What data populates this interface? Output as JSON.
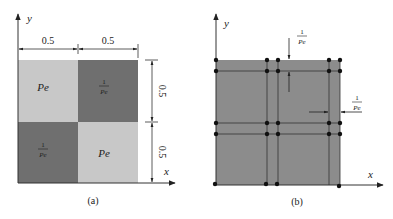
{
  "figure_a": {
    "caption": "(a)",
    "axis_x": "x",
    "axis_y": "y",
    "dim_top_left": "0.5",
    "dim_top_right": "0.5",
    "dim_right_top": "0.5",
    "dim_right_bottom": "0.5",
    "cells": [
      {
        "pos": "top-left",
        "label": "Pe",
        "shade": "light"
      },
      {
        "pos": "top-right",
        "label": "1/Pe",
        "num": "1",
        "den": "Pe",
        "shade": "dark"
      },
      {
        "pos": "bottom-left",
        "label": "1/Pe",
        "num": "1",
        "den": "Pe",
        "shade": "dark"
      },
      {
        "pos": "bottom-right",
        "label": "Pe",
        "shade": "light"
      }
    ]
  },
  "figure_b": {
    "caption": "(b)",
    "axis_x": "x",
    "axis_y": "y",
    "annot_top": {
      "num": "1",
      "den": "Pe"
    },
    "annot_right": {
      "num": "1",
      "den": "Pe"
    }
  },
  "colors": {
    "light": "#c8c8c8",
    "dark": "#6f6f6f",
    "mesh_fill": "#8c8c8c",
    "line": "#333333",
    "node": "#111111"
  }
}
